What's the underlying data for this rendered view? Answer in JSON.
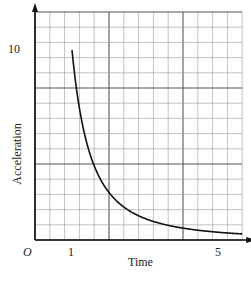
{
  "chart_data": {
    "type": "line",
    "title": "",
    "xlabel": "Time",
    "ylabel": "Acceleration",
    "origin_label": "O",
    "x_tick_labels": [
      {
        "value": 1,
        "label": "1"
      },
      {
        "value": 5,
        "label": "5"
      }
    ],
    "y_tick_labels": [
      {
        "value": 10,
        "label": "10"
      }
    ],
    "xlim": [
      0,
      5.6
    ],
    "ylim": [
      0,
      12
    ],
    "grid": true,
    "grid_minor_x": 0.4,
    "grid_major_x": 2,
    "grid_minor_y": 0.8,
    "grid_major_y": 4,
    "series": [
      {
        "name": "acceleration",
        "formula": "a = 10 / t^2",
        "x": [
          1,
          1.25,
          1.5,
          1.75,
          2,
          2.5,
          3,
          3.5,
          4,
          4.5,
          5,
          5.5
        ],
        "y": [
          10,
          6.4,
          4.44,
          3.27,
          2.5,
          1.6,
          1.11,
          0.82,
          0.63,
          0.49,
          0.4,
          0.33
        ]
      }
    ],
    "colors": {
      "curve": "#111111",
      "grid_minor": "#9a9a9a",
      "grid_major": "#555555",
      "axis": "#111111"
    }
  }
}
